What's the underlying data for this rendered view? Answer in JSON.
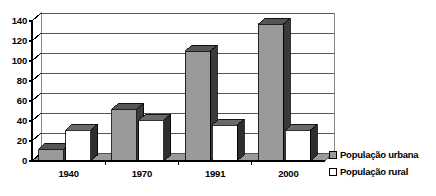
{
  "chart_data": {
    "type": "bar",
    "title": "",
    "subtitle": "",
    "xlabel": "",
    "ylabel": "",
    "categories": [
      "1940",
      "1970",
      "1991",
      "2000"
    ],
    "series": [
      {
        "name": "População urbana",
        "values": [
          12,
          52,
          110,
          137
        ],
        "color": "#9a9a9a"
      },
      {
        "name": "População rural",
        "values": [
          31,
          41,
          36,
          31
        ],
        "color": "#ffffff"
      }
    ],
    "ylim": [
      0,
      140
    ],
    "yticks": [
      0,
      20,
      40,
      60,
      80,
      100,
      120,
      140
    ],
    "ytick_labels": [
      "0",
      "20",
      "40",
      "60",
      "80",
      "100",
      "120",
      "140"
    ],
    "grid": true,
    "grid_axis": "y",
    "legend_position": "right",
    "style": "3d-column",
    "colors": {
      "urban_front": "#9a9a9a",
      "urban_side": "#3a3a3a",
      "urban_top": "#555555",
      "rural_front": "#ffffff",
      "rural_side": "#2e2e2e",
      "rural_top": "#6a6a6a",
      "wall": "#ffffff",
      "floor": "#9a9a9a",
      "gridline": "#555555",
      "axis": "#000000",
      "text": "#000000"
    }
  },
  "legend": {
    "items": [
      {
        "label": "População urbana",
        "swatch": "urban"
      },
      {
        "label": "População rural",
        "swatch": "rural"
      }
    ]
  }
}
